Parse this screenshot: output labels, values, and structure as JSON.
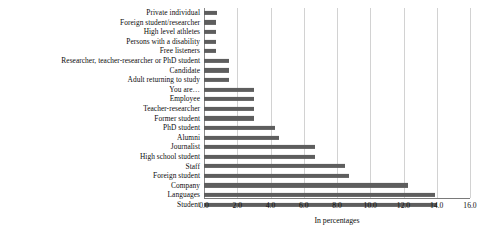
{
  "chart_data": {
    "type": "bar",
    "orientation": "horizontal",
    "title": "",
    "xlabel": "In percentages",
    "ylabel": "",
    "xlim": [
      0.0,
      16.0
    ],
    "xticks": [
      "0.0",
      "2.0",
      "4.0",
      "6.0",
      "8.0",
      "10.0",
      "12.0",
      "14.0",
      "16.0"
    ],
    "xtick_values": [
      0,
      2,
      4,
      6,
      8,
      10,
      12,
      14,
      16
    ],
    "grid": true,
    "legend": "none",
    "bar_color": "#5e5e5e",
    "grid_color": "#d2d2d2",
    "categories": [
      "Private individual",
      "Foreign student/researcher",
      "High level athletes",
      "Persons with a disability",
      "Free listeners",
      "Researcher, teacher-researcher or PhD student",
      "Candidate",
      "Adult returning to study",
      "You are…",
      "Employee",
      "Teacher-researcher",
      "Former student",
      "PhD student",
      "Alumni",
      "Journalist",
      "High school student",
      "Staff",
      "Foreign student",
      "Company",
      "Languages",
      "Student"
    ],
    "values": [
      0.8,
      0.7,
      0.7,
      0.7,
      0.7,
      1.5,
      1.5,
      1.5,
      3.0,
      3.0,
      3.0,
      3.0,
      4.3,
      4.5,
      6.7,
      6.7,
      8.5,
      8.7,
      12.3,
      13.9,
      14.0
    ]
  }
}
